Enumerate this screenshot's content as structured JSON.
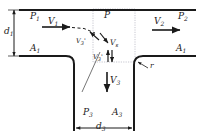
{
  "figure": {
    "type": "fluid-mechanics-tee-junction-control-volume",
    "stroke_color": "#1a1a1a",
    "control_volume_color": "#b9b9c4"
  },
  "labels": {
    "p1": "P",
    "p1_sub": "1",
    "p2": "P",
    "p2_sub": "2",
    "p3": "P",
    "p3_sub": "3",
    "pbar": "P",
    "a1_left": "A",
    "a1_left_sub": "1",
    "a1_right": "A",
    "a1_right_sub": "1",
    "a3": "A",
    "a3_sub": "3",
    "v1": "V",
    "v1_sub": "1",
    "v2": "V",
    "v2_sub": "2",
    "v3": "V",
    "v3_sub": "3",
    "v3p": "V",
    "v3p_sub": "3",
    "v3p_prime": "'",
    "vs": "V",
    "vs_sub": "s",
    "v3q": "V",
    "v3q_sub": "3",
    "v3q_prime": "'",
    "d1": "d",
    "d1_sub": "1",
    "d3": "d",
    "d3_sub": "3",
    "r": "r"
  },
  "geometry": {
    "main_duct_diameter_label": "d1",
    "branch_duct_width_label": "d3",
    "fillet_radius_label": "r",
    "inlet_velocity_label": "V1",
    "outlet_velocity_label": "V2",
    "branch_velocity_label": "V3",
    "mean_pressure_label": "Pbar"
  }
}
